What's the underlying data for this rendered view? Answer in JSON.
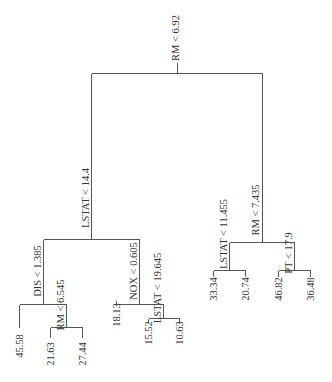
{
  "diagram": {
    "type": "regression-tree",
    "orientation": "top-down, labels rotated 90deg",
    "nodes": [
      {
        "id": "n_root",
        "label": "RM < 6.92",
        "x": 177,
        "ytop": 73,
        "ybot": 73,
        "lx": 175,
        "ly": 38
      },
      {
        "id": "n_lstat144",
        "label": "LSTAT < 14.4",
        "x": 91,
        "ytop": 73,
        "ybot": 239,
        "lx": 85,
        "ly": 198
      },
      {
        "id": "n_rm7435",
        "label": "RM < 7.435",
        "x": 261,
        "ytop": 73,
        "ybot": 242,
        "lx": 255,
        "ly": 210
      },
      {
        "id": "n_dis",
        "label": "DIS < 1.385",
        "x": 43,
        "ytop": 239,
        "ybot": 304,
        "lx": 37,
        "ly": 271
      },
      {
        "id": "n_nox",
        "label": "NOX < 0.605",
        "x": 139,
        "ytop": 239,
        "ybot": 304,
        "lx": 133,
        "ly": 271
      },
      {
        "id": "n_lstat11",
        "label": "LSTAT < 11.455",
        "x": 229,
        "ytop": 242,
        "ybot": 270,
        "lx": 223,
        "ly": 234
      },
      {
        "id": "n_pt",
        "label": "PT < 17.9",
        "x": 294,
        "ytop": 242,
        "ybot": 270,
        "lx": 288,
        "ly": 253
      },
      {
        "id": "n_rm6545",
        "label": "RM < 6.545",
        "x": 66,
        "ytop": 304,
        "ybot": 327,
        "lx": 60,
        "ly": 305
      },
      {
        "id": "n_lstat19",
        "label": "LSTAT < 19.645",
        "x": 163,
        "ytop": 304,
        "ybot": 318,
        "lx": 157,
        "ly": 288
      }
    ],
    "bars": [
      {
        "y": 73,
        "x1": 91,
        "x2": 262
      },
      {
        "y": 239,
        "x1": 43,
        "x2": 139
      },
      {
        "y": 242,
        "x1": 229,
        "x2": 294
      },
      {
        "y": 304,
        "x1": 19,
        "x2": 66
      },
      {
        "y": 304,
        "x1": 116,
        "x2": 163
      },
      {
        "y": 327,
        "x1": 50,
        "x2": 82
      },
      {
        "y": 318,
        "x1": 148,
        "x2": 179
      },
      {
        "y": 270,
        "x1": 213,
        "x2": 245
      },
      {
        "y": 270,
        "x1": 278,
        "x2": 310
      }
    ],
    "stems": [
      {
        "x": 177,
        "y1": 62,
        "y2": 73
      },
      {
        "x": 91,
        "y1": 73,
        "y2": 239
      },
      {
        "x": 262,
        "y1": 73,
        "y2": 242
      },
      {
        "x": 43,
        "y1": 239,
        "y2": 304
      },
      {
        "x": 139,
        "y1": 239,
        "y2": 304
      },
      {
        "x": 229,
        "y1": 242,
        "y2": 270
      },
      {
        "x": 294,
        "y1": 242,
        "y2": 270
      },
      {
        "x": 66,
        "y1": 304,
        "y2": 327
      },
      {
        "x": 163,
        "y1": 304,
        "y2": 318
      },
      {
        "x": 19,
        "y1": 304,
        "y2": 327
      },
      {
        "x": 116,
        "y1": 304,
        "y2": 300
      },
      {
        "x": 50,
        "y1": 327,
        "y2": 337
      },
      {
        "x": 82,
        "y1": 327,
        "y2": 337
      },
      {
        "x": 148,
        "y1": 318,
        "y2": 322
      },
      {
        "x": 179,
        "y1": 318,
        "y2": 322
      },
      {
        "x": 213,
        "y1": 270,
        "y2": 276
      },
      {
        "x": 245,
        "y1": 270,
        "y2": 276
      },
      {
        "x": 278,
        "y1": 270,
        "y2": 276
      },
      {
        "x": 310,
        "y1": 270,
        "y2": 276
      }
    ],
    "leaves": [
      {
        "value": "45.58",
        "x": 19,
        "ly": 346
      },
      {
        "value": "21.63",
        "x": 50,
        "ly": 354
      },
      {
        "value": "27.44",
        "x": 82,
        "ly": 354
      },
      {
        "value": "18.13",
        "x": 116,
        "ly": 315
      },
      {
        "value": "15.52",
        "x": 148,
        "ly": 333
      },
      {
        "value": "10.63",
        "x": 179,
        "ly": 333
      },
      {
        "value": "33.34",
        "x": 213,
        "ly": 289
      },
      {
        "value": "20.74",
        "x": 245,
        "ly": 289
      },
      {
        "value": "46.82",
        "x": 278,
        "ly": 289
      },
      {
        "value": "36.48",
        "x": 310,
        "ly": 289
      }
    ]
  }
}
